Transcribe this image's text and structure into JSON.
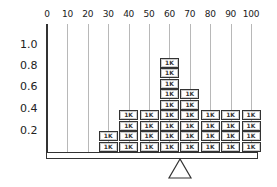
{
  "diagram": {
    "x_ticks": [
      "0",
      "10",
      "20",
      "30",
      "40",
      "50",
      "60",
      "70",
      "80",
      "90",
      "100"
    ],
    "y_ticks": [
      "1.0",
      "0.8",
      "0.6",
      "0.4",
      "0.2"
    ],
    "block_label": "1K",
    "stacks": [
      {
        "x": "0",
        "count": 0
      },
      {
        "x": "10",
        "count": 0
      },
      {
        "x": "20",
        "count": 0
      },
      {
        "x": "30",
        "count": 2
      },
      {
        "x": "40",
        "count": 4
      },
      {
        "x": "50",
        "count": 4
      },
      {
        "x": "60",
        "count": 9
      },
      {
        "x": "70",
        "count": 6
      },
      {
        "x": "80",
        "count": 4
      },
      {
        "x": "90",
        "count": 4
      },
      {
        "x": "100",
        "count": 4
      }
    ],
    "fulcrum_position": "~62"
  }
}
